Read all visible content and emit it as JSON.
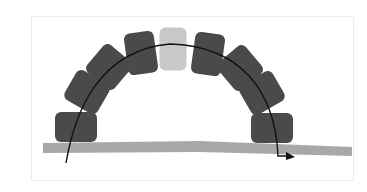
{
  "diagram": {
    "title": "",
    "colors": {
      "background": "#ffffff",
      "frame": "#ececec",
      "block": "#4a4a4a",
      "keystone": "#c8c8c8",
      "ground": "#a8a8a8",
      "arrow": "#111111"
    },
    "blocks": [
      {
        "id": "block-1",
        "cx": 76,
        "cy": 127,
        "w": 42,
        "h": 30,
        "rot": 0,
        "keystone": false
      },
      {
        "id": "block-2",
        "cx": 87,
        "cy": 92,
        "w": 38,
        "h": 34,
        "rot": 30,
        "keystone": false
      },
      {
        "id": "block-3",
        "cx": 109,
        "cy": 67,
        "w": 36,
        "h": 36,
        "rot": 40,
        "keystone": false
      },
      {
        "id": "block-4",
        "cx": 141,
        "cy": 53,
        "w": 30,
        "h": 42,
        "rot": -8,
        "keystone": false
      },
      {
        "id": "block-5",
        "cx": 173,
        "cy": 49,
        "w": 27,
        "h": 43,
        "rot": 0,
        "keystone": true
      },
      {
        "id": "block-6",
        "cx": 208,
        "cy": 54,
        "w": 30,
        "h": 42,
        "rot": 8,
        "keystone": false
      },
      {
        "id": "block-7",
        "cx": 240,
        "cy": 68,
        "w": 36,
        "h": 36,
        "rot": -40,
        "keystone": false
      },
      {
        "id": "block-8",
        "cx": 262,
        "cy": 93,
        "w": 38,
        "h": 34,
        "rot": -30,
        "keystone": false
      },
      {
        "id": "block-9",
        "cx": 272,
        "cy": 128,
        "w": 42,
        "h": 30,
        "rot": 0,
        "keystone": false
      }
    ],
    "ground": {
      "points": "43,143 200,141 352,147 352,156 200,152 43,153"
    },
    "force_path": {
      "d": "M66,163 C75,110 100,50 170,44 C240,46 275,90 278,156 L286,156",
      "arrowhead": "286,152 295,157 286,160"
    }
  }
}
